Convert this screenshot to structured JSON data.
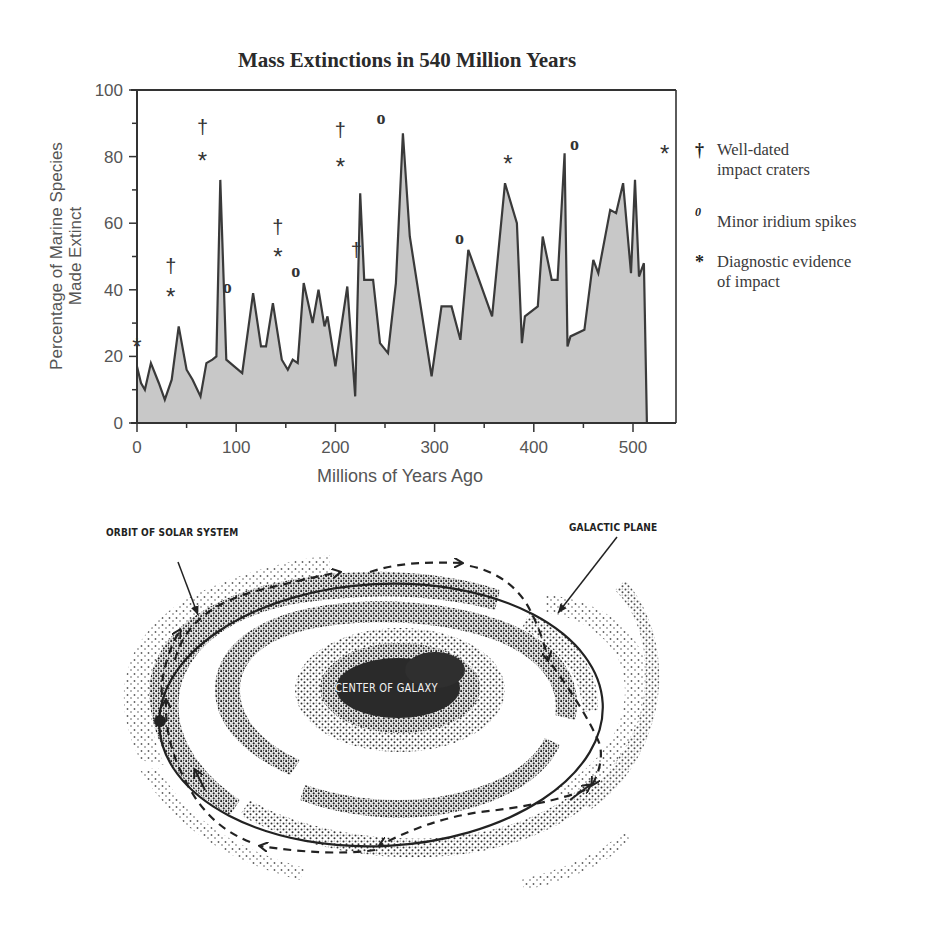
{
  "chart_data": {
    "type": "area",
    "title": "Mass Extinctions in 540 Million Years",
    "xlabel": "Millions of Years Ago",
    "ylabel": "Percentage of Marine Species Made Extinct",
    "xlim": [
      0,
      545
    ],
    "ylim": [
      0,
      100
    ],
    "x_ticks": [
      0,
      100,
      200,
      300,
      400,
      500
    ],
    "y_ticks": [
      0,
      20,
      40,
      60,
      80,
      100
    ],
    "grid": false,
    "legend_position": "right",
    "series": [
      {
        "name": "Percentage of marine species made extinct",
        "points": [
          [
            0,
            17
          ],
          [
            4,
            12
          ],
          [
            8,
            10
          ],
          [
            14,
            18
          ],
          [
            22,
            12
          ],
          [
            28,
            7
          ],
          [
            35,
            13
          ],
          [
            42,
            29
          ],
          [
            50,
            16
          ],
          [
            56,
            13
          ],
          [
            64,
            8
          ],
          [
            70,
            18
          ],
          [
            76,
            19
          ],
          [
            80,
            20
          ],
          [
            84,
            73
          ],
          [
            90,
            19
          ],
          [
            98,
            17
          ],
          [
            106,
            15
          ],
          [
            117,
            39
          ],
          [
            125,
            23
          ],
          [
            130,
            23
          ],
          [
            137,
            36
          ],
          [
            146,
            19
          ],
          [
            152,
            16
          ],
          [
            157,
            19
          ],
          [
            162,
            18
          ],
          [
            168,
            42
          ],
          [
            177,
            30
          ],
          [
            183,
            40
          ],
          [
            189,
            29
          ],
          [
            192,
            32
          ],
          [
            200,
            17
          ],
          [
            212,
            41
          ],
          [
            220,
            8
          ],
          [
            225,
            69
          ],
          [
            229,
            43
          ],
          [
            233,
            43
          ],
          [
            238,
            43
          ],
          [
            245,
            24
          ],
          [
            253,
            21
          ],
          [
            261,
            42
          ],
          [
            268,
            87
          ],
          [
            275,
            56
          ],
          [
            297,
            14
          ],
          [
            307,
            35
          ],
          [
            317,
            35
          ],
          [
            326,
            25
          ],
          [
            334,
            52
          ],
          [
            358,
            32
          ],
          [
            371,
            72
          ],
          [
            383,
            60
          ],
          [
            388,
            24
          ],
          [
            391,
            32
          ],
          [
            404,
            35
          ],
          [
            409,
            56
          ],
          [
            418,
            43
          ],
          [
            424,
            43
          ],
          [
            431,
            81
          ],
          [
            434,
            23
          ],
          [
            437,
            26
          ],
          [
            451,
            28
          ],
          [
            460,
            49
          ],
          [
            465,
            45
          ],
          [
            477,
            64
          ],
          [
            483,
            63
          ],
          [
            490,
            72
          ],
          [
            498,
            45
          ],
          [
            502,
            73
          ],
          [
            506,
            44
          ],
          [
            511,
            48
          ],
          [
            514,
            0
          ]
        ]
      }
    ],
    "markers": [
      {
        "x": 0,
        "y": 24,
        "symbol": "*"
      },
      {
        "x": 34,
        "y": 47,
        "symbol": "†"
      },
      {
        "x": 34,
        "y": 39,
        "symbol": "*"
      },
      {
        "x": 66,
        "y": 89,
        "symbol": "†"
      },
      {
        "x": 66,
        "y": 80,
        "symbol": "*"
      },
      {
        "x": 91,
        "y": 41,
        "symbol": "o"
      },
      {
        "x": 142,
        "y": 59,
        "symbol": "†"
      },
      {
        "x": 142,
        "y": 51,
        "symbol": "*"
      },
      {
        "x": 160,
        "y": 46,
        "symbol": "o"
      },
      {
        "x": 205,
        "y": 88,
        "symbol": "†"
      },
      {
        "x": 205,
        "y": 78,
        "symbol": "*"
      },
      {
        "x": 221,
        "y": 52,
        "symbol": "†"
      },
      {
        "x": 246,
        "y": 92,
        "symbol": "o"
      },
      {
        "x": 325,
        "y": 56,
        "symbol": "o"
      },
      {
        "x": 374,
        "y": 79,
        "symbol": "*"
      },
      {
        "x": 441,
        "y": 84,
        "symbol": "o"
      },
      {
        "x": 532,
        "y": 82,
        "symbol": "*"
      }
    ],
    "legend": [
      {
        "symbol": "†",
        "label": "Well-dated impact craters"
      },
      {
        "symbol": "o",
        "label": "Minor iridium spikes"
      },
      {
        "symbol": "*",
        "label": "Diagnostic evidence of impact"
      }
    ]
  },
  "chart": {
    "title": "Mass Extinctions in 540 Million Years",
    "xlabel": "Millions of Years Ago",
    "ylabel_line1": "Percentage of Marine Species",
    "ylabel_line2": "Made Extinct",
    "x_tick_labels": [
      "0",
      "100",
      "200",
      "300",
      "400",
      "500"
    ],
    "y_tick_labels": [
      "0",
      "20",
      "40",
      "60",
      "80",
      "100"
    ]
  },
  "legend": {
    "items": [
      {
        "symbol": "†",
        "line1": "Well-dated",
        "line2": "impact craters"
      },
      {
        "symbol": "0",
        "line1": "Minor iridium spikes",
        "line2": ""
      },
      {
        "symbol": "*",
        "line1": "Diagnostic evidence",
        "line2": "of impact"
      }
    ]
  },
  "diagram": {
    "label_orbit": "ORBIT OF SOLAR SYSTEM",
    "label_plane": "GALACTIC PLANE",
    "label_center": "CENTER OF GALAXY"
  },
  "colors": {
    "fill": "#c8c8c8",
    "line": "#3a3a3a",
    "text": "#3a3a3a",
    "ink": "#222222"
  }
}
